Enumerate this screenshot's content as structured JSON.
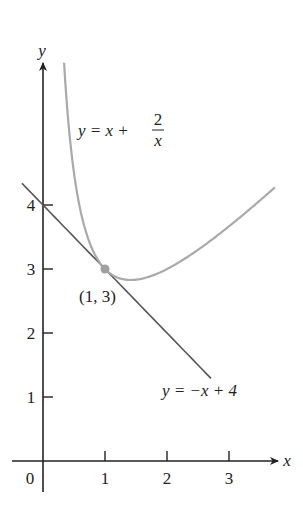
{
  "chart_data": {
    "type": "line",
    "title": "",
    "xlabel": "x",
    "ylabel": "y",
    "xlim": [
      -0.35,
      3.8
    ],
    "ylim": [
      -0.5,
      6.2
    ],
    "grid": false,
    "xticks": [
      0,
      1,
      2,
      3
    ],
    "xtick_labels": [
      "0",
      "1",
      "2",
      "3"
    ],
    "yticks": [
      1,
      2,
      3,
      4
    ],
    "ytick_labels": [
      "1",
      "2",
      "3",
      "4"
    ],
    "series": [
      {
        "name": "y = x + 2/x",
        "expression": "x + 2/x",
        "color": "#a9a9a9",
        "x_range": [
          0.34,
          3.74
        ],
        "x": [
          0.34,
          0.4,
          0.5,
          0.6,
          0.8,
          1.0,
          1.2,
          1.414,
          1.6,
          2.0,
          2.5,
          3.0,
          3.5,
          3.74
        ],
        "values": [
          6.22,
          5.4,
          4.5,
          3.93,
          3.3,
          3.0,
          2.87,
          2.83,
          2.85,
          3.0,
          3.3,
          3.67,
          4.07,
          4.27
        ]
      },
      {
        "name": "y = -x + 4",
        "expression": "-x + 4",
        "color": "#555555",
        "x_range": [
          -0.34,
          2.71
        ],
        "x": [
          -0.34,
          0,
          1,
          2,
          2.71
        ],
        "values": [
          4.34,
          4,
          3,
          2,
          1.29
        ]
      }
    ],
    "points": [
      {
        "x": 1,
        "y": 3,
        "label": "(1, 3)",
        "color": "#a0a0a0"
      }
    ],
    "annotations": [
      {
        "text": "y = x + 2/x",
        "target": "curve"
      },
      {
        "text": "y = -x + 4",
        "target": "line"
      },
      {
        "text": "(1, 3)",
        "target": "point"
      }
    ]
  },
  "labels": {
    "x_axis": "x",
    "y_axis": "y",
    "curve_lhs": "y = x + ",
    "curve_num": "2",
    "curve_den": "x",
    "line_eq": "y = −x + 4",
    "point": "(1, 3)",
    "xt0": "0",
    "xt1": "1",
    "xt2": "2",
    "xt3": "3",
    "yt1": "1",
    "yt2": "2",
    "yt3": "3",
    "yt4": "4"
  }
}
